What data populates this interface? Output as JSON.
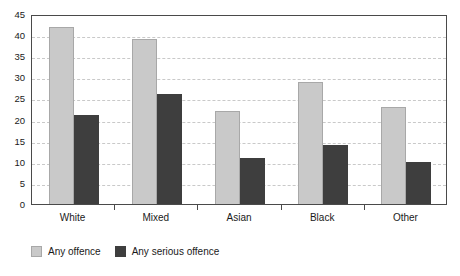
{
  "chart_data": {
    "type": "bar",
    "title": "",
    "subtitle": "",
    "xlabel": "",
    "ylabel": "",
    "categories": [
      "White",
      "Mixed",
      "Asian",
      "Black",
      "Other"
    ],
    "series": [
      {
        "name": "Any offence",
        "color": "#c9c9c9",
        "values": [
          42,
          39,
          22,
          29,
          23
        ]
      },
      {
        "name": "Any serious offence",
        "color": "#3e3e3e",
        "values": [
          21,
          26,
          11,
          14,
          10
        ]
      }
    ],
    "ylim": [
      0,
      45
    ],
    "ytick_step": 5,
    "yticks": [
      0,
      5,
      10,
      15,
      20,
      25,
      30,
      35,
      40,
      45
    ],
    "ytick_labels": [
      "0",
      "5",
      "10",
      "15",
      "20",
      "25",
      "30",
      "35",
      "40",
      "45"
    ],
    "grid": true,
    "grid_style": "dashed-horizontal",
    "legend_position": "bottom-left",
    "annotations": []
  },
  "legend": {
    "items": [
      {
        "label": "Any offence",
        "swatch": "light-gray-swatch"
      },
      {
        "label": "Any serious offence",
        "swatch": "dark-gray-swatch"
      }
    ]
  },
  "colors": {
    "series_light": "#c9c9c9",
    "series_dark": "#3e3e3e",
    "axis": "#4a4a4a",
    "gridline": "#c9c9c9",
    "text": "#1a1a1a",
    "background": "#ffffff"
  }
}
